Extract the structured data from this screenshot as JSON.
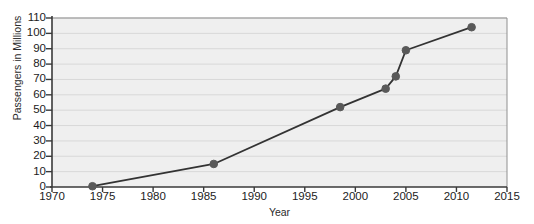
{
  "chart_data": {
    "type": "line",
    "title": "",
    "xlabel": "Year",
    "ylabel": "Passengers in Millions",
    "xlim": [
      1970,
      2015
    ],
    "ylim": [
      0,
      110
    ],
    "xticks": [
      1970,
      1975,
      1980,
      1985,
      1990,
      1995,
      2000,
      2005,
      2010,
      2015
    ],
    "xtick_labels": [
      "1970",
      "1975",
      "1980",
      "1985",
      "1990",
      "1995",
      "2000",
      "2005",
      "2010",
      "2015"
    ],
    "yticks": [
      0,
      10,
      20,
      30,
      40,
      50,
      60,
      70,
      80,
      90,
      100,
      110
    ],
    "ytick_labels": [
      "0",
      "10",
      "20",
      "30",
      "40",
      "50",
      "60",
      "70",
      "80",
      "90",
      "100",
      "110"
    ],
    "grid": "horizontal",
    "legend": "none",
    "series": [
      {
        "name": "Passengers",
        "x": [
          1974,
          1986,
          1998.5,
          2003,
          2004,
          2005,
          2011.5
        ],
        "values": [
          0.5,
          15,
          52,
          64,
          72,
          89,
          104
        ]
      }
    ],
    "marker": "circle",
    "marker_color": "#595959",
    "line_color": "#333333",
    "plot_background": "#efefef"
  },
  "axis_style": {
    "axis_color": "#3a3a3a",
    "grid_color": "#d8d8d8",
    "text_color": "#1c1c1c"
  }
}
